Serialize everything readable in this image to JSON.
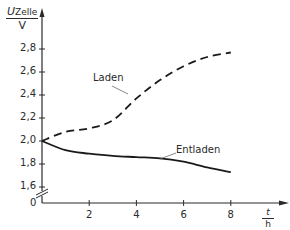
{
  "chart_data": {
    "type": "line",
    "title": "",
    "xlabel": "t / h",
    "ylabel": "U_Zelle / V",
    "ylabel_parts": {
      "symbol": "U",
      "subscript": "Zelle",
      "unit": "V"
    },
    "xlabel_parts": {
      "symbol": "t",
      "unit": "h"
    },
    "x_ticks": [
      2,
      4,
      6,
      8
    ],
    "x_tick_labels": [
      "2",
      "4",
      "6",
      "8"
    ],
    "y_ticks": [
      1.6,
      1.8,
      2.0,
      2.2,
      2.4,
      2.6,
      2.8
    ],
    "y_tick_labels": [
      "1,6",
      "1,8",
      "2,0",
      "2,2",
      "2,4",
      "2,6",
      "2,8"
    ],
    "y_origin_label": "0",
    "y_axis_break": true,
    "xlim": [
      0,
      9.5
    ],
    "ylim": [
      1.5,
      3.0
    ],
    "grid": false,
    "legend": "inline annotations",
    "x": [
      0,
      1,
      2,
      3,
      4,
      5,
      6,
      7,
      8
    ],
    "series": [
      {
        "name": "Laden",
        "style": "dashed",
        "values": [
          2.0,
          2.08,
          2.11,
          2.18,
          2.37,
          2.53,
          2.65,
          2.73,
          2.77
        ]
      },
      {
        "name": "Entladen",
        "style": "solid",
        "values": [
          2.0,
          1.92,
          1.89,
          1.87,
          1.86,
          1.85,
          1.82,
          1.77,
          1.73
        ]
      }
    ]
  }
}
